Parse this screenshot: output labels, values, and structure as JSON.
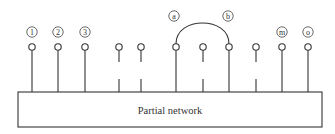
{
  "diagram": {
    "network_label": "Partial network",
    "nodes": [
      {
        "label": "1",
        "connected": true
      },
      {
        "label": "2",
        "connected": true
      },
      {
        "label": "3",
        "connected": true
      },
      {
        "label": "",
        "connected": false
      },
      {
        "label": "",
        "connected": false
      },
      {
        "label": "a",
        "connected": true
      },
      {
        "label": "",
        "connected": false
      },
      {
        "label": "b",
        "connected": true
      },
      {
        "label": "",
        "connected": false
      },
      {
        "label": "m",
        "connected": true
      },
      {
        "label": "o",
        "connected": true
      }
    ],
    "arc": {
      "from": "a",
      "to": "b"
    }
  }
}
